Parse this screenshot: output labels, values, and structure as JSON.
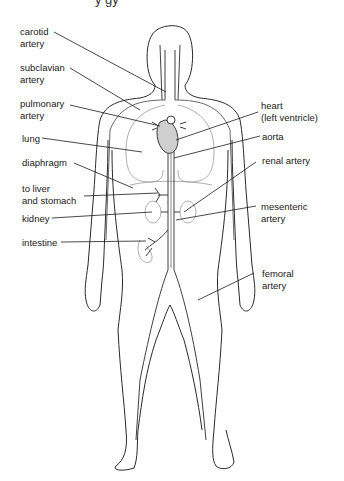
{
  "title_fragment": "y   gy",
  "labels": {
    "carotid_artery": {
      "line1": "carotid",
      "line2": "artery"
    },
    "subclavian_artery": {
      "line1": "subclavian",
      "line2": "artery"
    },
    "pulmonary_artery": {
      "line1": "pulmonary",
      "line2": "artery"
    },
    "lung": {
      "line1": "lung"
    },
    "diaphragm": {
      "line1": "diaphragm"
    },
    "liver_stomach": {
      "line1": "to liver",
      "line2": "and stomach"
    },
    "kidney": {
      "line1": "kidney"
    },
    "intestine": {
      "line1": "intestine"
    },
    "heart": {
      "line1": "heart",
      "line2": "(left ventricle)"
    },
    "aorta": {
      "line1": "aorta"
    },
    "renal_artery": {
      "line1": "renal artery"
    },
    "mesenteric_artery": {
      "line1": "mesenteric",
      "line2": "artery"
    },
    "femoral_artery": {
      "line1": "femoral",
      "line2": "artery"
    }
  },
  "colors": {
    "outline": "#2a2a2a",
    "vessel_fill": "#cfcfcf",
    "organ_line": "#9a9a9a",
    "leader_line": "#1a1a1a"
  }
}
